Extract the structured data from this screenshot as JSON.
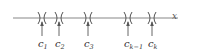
{
  "diagram": {
    "title": "",
    "axis_label": "x",
    "line": {
      "x1": 13,
      "x2": 178,
      "y": 18,
      "color": "#777777"
    },
    "points": [
      {
        "name": "c",
        "sub": "1",
        "x": 42
      },
      {
        "name": "c",
        "sub": "2",
        "x": 59
      },
      {
        "name": "c",
        "sub": "3",
        "x": 88
      },
      {
        "name": "c",
        "sub": "k−1",
        "x": 128
      },
      {
        "name": "c",
        "sub": "k",
        "x": 152
      }
    ]
  }
}
